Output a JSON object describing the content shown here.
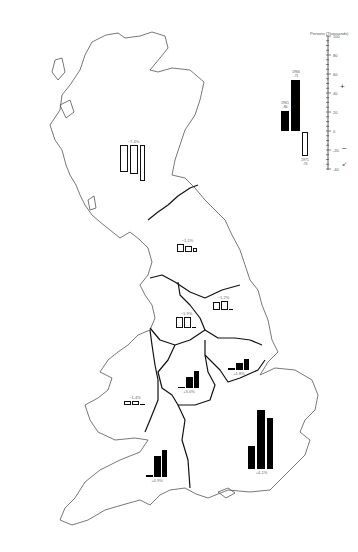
{
  "legend": {
    "title": "Persons (Thousands)",
    "axis_ticks": [
      "100",
      "80",
      "60",
      "40",
      "20",
      "0",
      "-20",
      "-40"
    ],
    "bar_labels": {
      "first": "1961\n-66",
      "second": "1966\n-71",
      "third": "1971\n-74"
    },
    "symbols": {
      "gain": "+",
      "loss": "−",
      "other": "↙"
    }
  },
  "regions": [
    {
      "name": "Scotland",
      "label": "−7.4%",
      "values": [
        -28,
        -30,
        -38
      ]
    },
    {
      "name": "North",
      "label": "−1.1%",
      "values": [
        -8,
        -6,
        -4
      ]
    },
    {
      "name": "Yorkshire and Humberside",
      "label": "−1.2%",
      "values": [
        -8,
        -10,
        1
      ]
    },
    {
      "name": "North West",
      "label": "−1.9%",
      "values": [
        -12,
        -12,
        1
      ]
    },
    {
      "name": "East Midlands",
      "label": "+1.8%",
      "values": [
        2,
        7,
        12
      ]
    },
    {
      "name": "West Midlands",
      "label": "+3.0%",
      "values": [
        1,
        12,
        18
      ]
    },
    {
      "name": "Wales",
      "label": "−1.4%",
      "values": [
        -4,
        -4,
        1
      ]
    },
    {
      "name": "South West",
      "label": "+4.9%",
      "values": [
        2,
        22,
        28
      ]
    },
    {
      "name": "South East",
      "label": "+4.1%",
      "values": [
        24,
        62,
        54
      ]
    }
  ],
  "chart_data": {
    "type": "bar",
    "ylabel": "Persons (Thousands)",
    "ylim": [
      -40,
      100
    ],
    "categories": [
      "Scotland",
      "North",
      "Yorkshire and Humberside",
      "North West",
      "East Midlands",
      "West Midlands",
      "Wales",
      "South West",
      "South East"
    ],
    "series": [
      {
        "name": "Period 1",
        "values": [
          -28,
          -8,
          -8,
          -12,
          2,
          1,
          -4,
          2,
          24
        ]
      },
      {
        "name": "Period 2",
        "values": [
          -30,
          -6,
          -10,
          -12,
          7,
          12,
          -4,
          22,
          62
        ]
      },
      {
        "name": "Period 3",
        "values": [
          -38,
          -4,
          1,
          1,
          12,
          18,
          1,
          28,
          54
        ]
      }
    ],
    "percent_labels": [
      "−7.4%",
      "−1.1%",
      "−1.2%",
      "−1.9%",
      "+1.8%",
      "+3.0%",
      "−1.4%",
      "+4.9%",
      "+4.1%"
    ],
    "legend_example": {
      "values": [
        22,
        57,
        -25
      ]
    }
  }
}
